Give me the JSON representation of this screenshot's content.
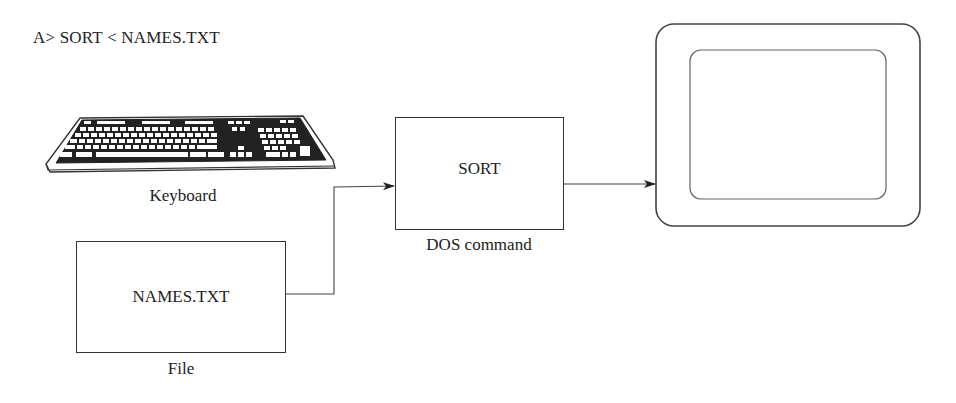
{
  "command_line": "A> SORT < NAMES.TXT",
  "nodes": {
    "keyboard": {
      "label": "Keyboard",
      "icon": "keyboard-icon"
    },
    "sort": {
      "text": "SORT",
      "label": "DOS command"
    },
    "file": {
      "text": "NAMES.TXT",
      "label": "File"
    },
    "monitor": {
      "icon": "monitor-screen-icon"
    }
  },
  "edges": [
    {
      "from": "file",
      "to": "sort",
      "style": "elbow-arrow"
    },
    {
      "from": "sort",
      "to": "monitor",
      "style": "straight-arrow"
    }
  ],
  "colors": {
    "stroke": "#333333",
    "background": "#ffffff"
  }
}
